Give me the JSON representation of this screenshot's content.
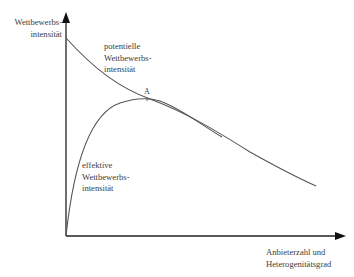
{
  "diagram": {
    "y_axis": {
      "label_line1": "Wettbewerbs-",
      "label_line2": "intensität"
    },
    "x_axis": {
      "label_line1": "Anbieterzahl und",
      "label_line2": "Heterogenitätsgrad"
    },
    "curves": [
      {
        "name": "potentielle Wettbewerbsintensität",
        "label_line1": "potentielle",
        "label_line2": "Wettbewerbs-",
        "label_line3": "intensität",
        "shape": "monotonically decreasing"
      },
      {
        "name": "effektive Wettbewerbsintensität",
        "label_line1": "effektive",
        "label_line2": "Wettbewerbs-",
        "label_line3": "intensität",
        "shape": "rises from origin, peaks at A, then converges with potential curve"
      }
    ],
    "point_marker": "A",
    "colors": {
      "line": "#555555",
      "axis": "#222222",
      "text": "#3c3c3c"
    }
  }
}
